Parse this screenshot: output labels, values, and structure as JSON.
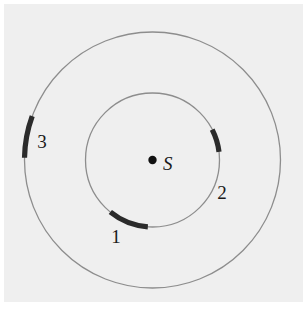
{
  "figure": {
    "background_color": "#ffffff",
    "plot_background_color": "#efefef",
    "orbit_stroke_color": "#8d8d8d",
    "arc_color": "#2b2b2b",
    "label_color": "#1a1a1a"
  },
  "center": {
    "label": "S",
    "x": 152.5,
    "y": 160,
    "dot_radius": 4.2,
    "label_x": 163,
    "label_y": 170
  },
  "orbits": [
    {
      "name": "inner-orbit",
      "radius": 67,
      "stroke_width": 1.3
    },
    {
      "name": "outer-orbit",
      "radius": 128,
      "stroke_width": 1.3
    }
  ],
  "arcs": [
    {
      "id": "arc-1",
      "label": "1",
      "orbit": "inner",
      "radius": 67,
      "start_deg": 94,
      "end_deg": 129,
      "stroke_width": 5.2,
      "label_x": 116,
      "label_y": 243
    },
    {
      "id": "arc-2",
      "label": "2",
      "orbit": "inner",
      "radius": 67,
      "start_deg": 333,
      "end_deg": 353,
      "stroke_width": 5.2,
      "label_x": 222,
      "label_y": 199
    },
    {
      "id": "arc-3",
      "label": "3",
      "orbit": "outer",
      "radius": 128,
      "start_deg": 181,
      "end_deg": 200,
      "stroke_width": 5.2,
      "label_x": 42,
      "label_y": 148
    }
  ],
  "plot_area": {
    "x": 4,
    "y": 4,
    "width": 299,
    "height": 298
  }
}
